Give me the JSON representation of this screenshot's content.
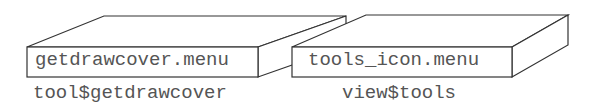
{
  "diagram": {
    "boxes": [
      {
        "face_label": "getdrawcover.menu",
        "caption": "tool$getdrawcover"
      },
      {
        "face_label": "tools_icon.menu",
        "caption": "view$tools"
      }
    ],
    "colors": {
      "stroke": "#333333",
      "text": "#555555",
      "background": "#ffffff"
    }
  }
}
